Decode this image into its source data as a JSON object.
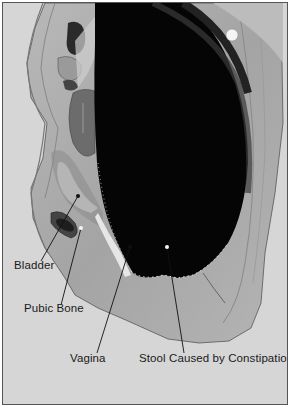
{
  "figure": {
    "type": "anatomical sagittal section",
    "background_color": "#d6d6d6",
    "labels": [
      {
        "id": "bladder",
        "text": "Bladder",
        "x": 11,
        "y": 262
      },
      {
        "id": "pubic-bone",
        "text": "Pubic Bone",
        "x": 21,
        "y": 305
      },
      {
        "id": "vagina",
        "text": "Vagina",
        "x": 67,
        "y": 354
      },
      {
        "id": "stool",
        "text": "Stool Caused by Constipation",
        "x": 136,
        "y": 354
      }
    ]
  }
}
